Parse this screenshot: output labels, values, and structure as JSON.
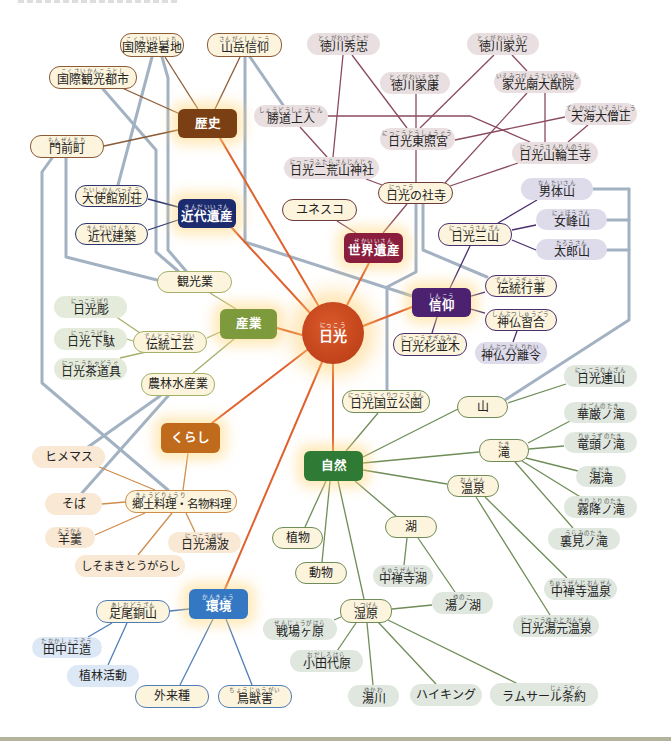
{
  "center": {
    "label": "日光",
    "ruby": "にっこう",
    "color": "#c5461c"
  },
  "categories": [
    {
      "id": "history",
      "label": "歴史",
      "color": "#7b3f14"
    },
    {
      "id": "modern_heritage",
      "label": "近代遺産",
      "ruby": "きんだいいさん",
      "color": "#1c2a6e"
    },
    {
      "id": "world_heritage",
      "label": "世界遺産",
      "ruby": "せかいいさん",
      "color": "#8a1d3d"
    },
    {
      "id": "faith",
      "label": "信仰",
      "ruby": "しんこう",
      "color": "#4b2170"
    },
    {
      "id": "industry",
      "label": "産業",
      "color": "#7d9a3c"
    },
    {
      "id": "living",
      "label": "くらし",
      "color": "#c06a1c"
    },
    {
      "id": "nature",
      "label": "自然",
      "color": "#2f7a34"
    },
    {
      "id": "environment",
      "label": "環境",
      "ruby": "かんきょう",
      "color": "#3478c4"
    }
  ],
  "history": [
    {
      "label": "国際避暑地",
      "ruby": "こくさいひしょち"
    },
    {
      "label": "山岳信仰",
      "ruby": "さんがくしんこう"
    },
    {
      "label": "国際観光都市",
      "ruby": "こくさいかんこうとし"
    },
    {
      "label": "門前町",
      "ruby": "もんぜんまち"
    }
  ],
  "heritage_sites": [
    {
      "label": "徳川秀忠",
      "ruby": "とくがわひでただ"
    },
    {
      "label": "徳川家光",
      "ruby": "とくがわいえみつ"
    },
    {
      "label": "徳川家康",
      "ruby": "とくがわいえやす"
    },
    {
      "label": "家光廟大猷院",
      "ruby": "いえみつびょうたいゆういん"
    },
    {
      "label": "勝道上人",
      "ruby": "しょうどうしょうにん"
    },
    {
      "label": "天海大僧正",
      "ruby": "てんかいだいそうじょう"
    },
    {
      "label": "日光東照宮",
      "ruby": "にっこうとうしょうぐう"
    },
    {
      "label": "日光山輪王寺",
      "ruby": "にっこうさんりんのうじ"
    },
    {
      "label": "日光二荒山神社",
      "ruby": "にっこうふたらさんじんじゃ"
    }
  ],
  "world_heritage": [
    {
      "label": "日光の社寺",
      "ruby": "にっこう"
    },
    {
      "label": "ユネスコ"
    }
  ],
  "modern_heritage": [
    {
      "label": "大使館別荘",
      "ruby": "たいしかんべっそう"
    },
    {
      "label": "近代建築",
      "ruby": "きんだいけんちく"
    }
  ],
  "faith": [
    {
      "label": "男体山",
      "ruby": "なんたいさん"
    },
    {
      "label": "女峰山",
      "ruby": "にょほうさん"
    },
    {
      "label": "太郎山",
      "ruby": "たろうさん"
    },
    {
      "label": "日光三山",
      "ruby": "にっこうさんざん"
    },
    {
      "label": "伝統行事",
      "ruby": "でんとうぎょうじ"
    },
    {
      "label": "神仏習合",
      "ruby": "しんぶつしゅうごう"
    },
    {
      "label": "神仏分離令",
      "ruby": "しんぶつぶんりれい"
    },
    {
      "label": "日光杉並木",
      "ruby": "にっこうすぎなみき"
    }
  ],
  "industry": [
    {
      "label": "観光業"
    },
    {
      "label": "伝統工芸",
      "ruby": "でんとうこうげい"
    },
    {
      "label": "日光彫",
      "ruby": "にっこうぼり"
    },
    {
      "label": "日光下駄",
      "ruby": "にっこうげた"
    },
    {
      "label": "日光茶道具",
      "ruby": "にっこうちゃどうぐ"
    },
    {
      "label": "農林水産業"
    }
  ],
  "living": [
    {
      "label": "ヒメマス"
    },
    {
      "label": "郷土料理・名物料理",
      "ruby": "きょうどりょうり"
    },
    {
      "label": "そば"
    },
    {
      "label": "羊羹",
      "ruby": "ようかん"
    },
    {
      "label": "日光湯波",
      "ruby": "にっこうゆば"
    },
    {
      "label": "しそまきとうがらし"
    }
  ],
  "environment": [
    {
      "label": "足尾銅山",
      "ruby": "あしおどうざん"
    },
    {
      "label": "田中正造",
      "ruby": "たなかしょうぞう"
    },
    {
      "label": "植林活動"
    },
    {
      "label": "外来種"
    },
    {
      "label": "鳥獣害",
      "ruby": "ちょうじゅうがい"
    }
  ],
  "nature": [
    {
      "label": "日光国立公園",
      "ruby": "にっこうこくりつこうえん"
    },
    {
      "label": "山"
    },
    {
      "label": "日光連山",
      "ruby": "にっこうれんざん"
    },
    {
      "label": "華厳ノ滝",
      "ruby": "けごんのたき"
    },
    {
      "label": "竜頭ノ滝",
      "ruby": "りゅうずのたき"
    },
    {
      "label": "湯滝",
      "ruby": "ゆだき"
    },
    {
      "label": "霧降ノ滝",
      "ruby": "きりふりのたき"
    },
    {
      "label": "裏見ノ滝",
      "ruby": "うらみのたき"
    },
    {
      "label": "滝",
      "ruby": "たき"
    },
    {
      "label": "温泉",
      "ruby": "おんせん"
    },
    {
      "label": "中禅寺温泉",
      "ruby": "ちゅうぜんじおんせん"
    },
    {
      "label": "日光湯元温泉",
      "ruby": "にっこうゆもとおんせん"
    },
    {
      "label": "植物"
    },
    {
      "label": "動物"
    },
    {
      "label": "湖"
    },
    {
      "label": "中禅寺湖",
      "ruby": "ちゅうぜんじこ"
    },
    {
      "label": "湯ノ湖",
      "ruby": "ゆのこ"
    },
    {
      "label": "湿原",
      "ruby": "しつげん"
    },
    {
      "label": "戦場ヶ原",
      "ruby": "せんじょうがはら"
    },
    {
      "label": "小田代原",
      "ruby": "おだしろはら"
    },
    {
      "label": "湯川",
      "ruby": "ゆかわ"
    },
    {
      "label": "ハイキング"
    },
    {
      "label": "ラムサール条約",
      "ruby": "じょうやく"
    }
  ],
  "edges": {
    "center": [
      [
        "日光",
        "歴史"
      ],
      [
        "日光",
        "近代遺産"
      ],
      [
        "日光",
        "世界遺産"
      ],
      [
        "日光",
        "信仰"
      ],
      [
        "日光",
        "産業"
      ],
      [
        "日光",
        "くらし"
      ],
      [
        "日光",
        "自然"
      ],
      [
        "日光",
        "環境"
      ]
    ],
    "history": [
      [
        "歴史",
        "国際避暑地"
      ],
      [
        "歴史",
        "山岳信仰"
      ],
      [
        "歴史",
        "国際観光都市"
      ],
      [
        "歴史",
        "門前町"
      ]
    ],
    "modern_heritage": [
      [
        "近代遺産",
        "大使館別荘"
      ],
      [
        "近代遺産",
        "近代建築"
      ]
    ],
    "world_heritage": [
      [
        "世界遺産",
        "ユネスコ"
      ],
      [
        "世界遺産",
        "日光の社寺"
      ],
      [
        "日光の社寺",
        "日光東照宮"
      ],
      [
        "日光の社寺",
        "日光二荒山神社"
      ],
      [
        "日光の社寺",
        "日光山輪王寺"
      ],
      [
        "日光の社寺",
        "家光廟大猷院"
      ],
      [
        "日光東照宮",
        "徳川家康"
      ],
      [
        "日光東照宮",
        "徳川秀忠"
      ],
      [
        "日光東照宮",
        "徳川家光"
      ],
      [
        "日光東照宮",
        "天海大僧正"
      ],
      [
        "日光二荒山神社",
        "徳川秀忠"
      ],
      [
        "日光二荒山神社",
        "勝道上人"
      ],
      [
        "日光山輪王寺",
        "勝道上人"
      ],
      [
        "日光山輪王寺",
        "天海大僧正"
      ],
      [
        "日光山輪王寺",
        "家光廟大猷院"
      ],
      [
        "家光廟大猷院",
        "徳川家光"
      ]
    ],
    "faith": [
      [
        "信仰",
        "日光三山"
      ],
      [
        "日光三山",
        "男体山"
      ],
      [
        "日光三山",
        "女峰山"
      ],
      [
        "日光三山",
        "太郎山"
      ],
      [
        "信仰",
        "伝統行事"
      ],
      [
        "信仰",
        "神仏習合"
      ],
      [
        "神仏習合",
        "神仏分離令"
      ],
      [
        "信仰",
        "日光杉並木"
      ]
    ],
    "industry": [
      [
        "産業",
        "観光業"
      ],
      [
        "産業",
        "伝統工芸"
      ],
      [
        "伝統工芸",
        "日光彫"
      ],
      [
        "伝統工芸",
        "日光下駄"
      ],
      [
        "伝統工芸",
        "日光茶道具"
      ],
      [
        "産業",
        "農林水産業"
      ]
    ],
    "living": [
      [
        "くらし",
        "郷土料理・名物料理"
      ],
      [
        "郷土料理・名物料理",
        "ヒメマス"
      ],
      [
        "郷土料理・名物料理",
        "そば"
      ],
      [
        "郷土料理・名物料理",
        "羊羹"
      ],
      [
        "郷土料理・名物料理",
        "日光湯波"
      ],
      [
        "郷土料理・名物料理",
        "しそまきとうがらし"
      ]
    ],
    "environment": [
      [
        "環境",
        "足尾銅山"
      ],
      [
        "足尾銅山",
        "田中正造"
      ],
      [
        "足尾銅山",
        "植林活動"
      ],
      [
        "環境",
        "外来種"
      ],
      [
        "環境",
        "鳥獣害"
      ]
    ],
    "nature": [
      [
        "自然",
        "日光国立公園"
      ],
      [
        "自然",
        "山"
      ],
      [
        "山",
        "日光連山"
      ],
      [
        "自然",
        "滝"
      ],
      [
        "滝",
        "華厳ノ滝"
      ],
      [
        "滝",
        "竜頭ノ滝"
      ],
      [
        "滝",
        "湯滝"
      ],
      [
        "滝",
        "霧降ノ滝"
      ],
      [
        "滝",
        "裏見ノ滝"
      ],
      [
        "自然",
        "温泉"
      ],
      [
        "温泉",
        "中禅寺温泉"
      ],
      [
        "温泉",
        "日光湯元温泉"
      ],
      [
        "自然",
        "植物"
      ],
      [
        "自然",
        "動物"
      ],
      [
        "自然",
        "湖"
      ],
      [
        "湖",
        "中禅寺湖"
      ],
      [
        "湖",
        "湯ノ湖"
      ],
      [
        "自然",
        "湿原"
      ],
      [
        "湿原",
        "湯ノ湖"
      ],
      [
        "湿原",
        "戦場ヶ原"
      ],
      [
        "湿原",
        "小田代原"
      ],
      [
        "湿原",
        "湯川"
      ],
      [
        "湿原",
        "ハイキング"
      ],
      [
        "湿原",
        "ラムサール条約"
      ]
    ],
    "cross_links": [
      [
        "国際避暑地",
        "大使館別荘"
      ],
      [
        "国際避暑地",
        "観光業"
      ],
      [
        "国際観光都市",
        "観光業"
      ],
      [
        "門前町",
        "観光業"
      ],
      [
        "門前町",
        "郷土料理・名物料理"
      ],
      [
        "山岳信仰",
        "勝道上人"
      ],
      [
        "山岳信仰",
        "信仰"
      ],
      [
        "日光の社寺",
        "日光国立公園"
      ],
      [
        "日光の社寺",
        "伝統行事"
      ],
      [
        "男体山",
        "山"
      ],
      [
        "女峰山",
        "山"
      ],
      [
        "太郎山",
        "山"
      ],
      [
        "農林水産業",
        "ヒメマス"
      ],
      [
        "農林水産業",
        "そば"
      ]
    ]
  },
  "colors": {
    "center_links": "#e0622e",
    "cross_links": "#a3b2c2",
    "cream_fill": "#fcf4dc"
  }
}
